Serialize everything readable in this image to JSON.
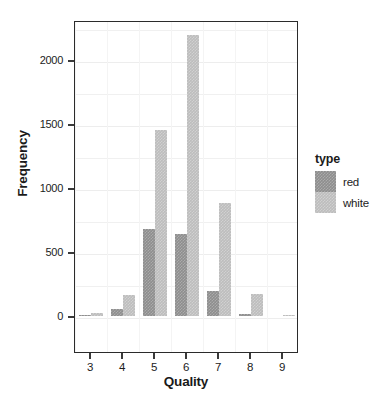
{
  "chart_data": {
    "type": "bar",
    "title": "",
    "xlabel": "Quality",
    "ylabel": "Frequency",
    "categories": [
      "3",
      "4",
      "5",
      "6",
      "7",
      "8",
      "9"
    ],
    "series": [
      {
        "name": "red",
        "color": "#8e8e8e",
        "values": [
          10,
          53,
          681,
          638,
          199,
          18,
          0
        ]
      },
      {
        "name": "white",
        "color": "#bdbdbd",
        "values": [
          20,
          163,
          1457,
          2198,
          880,
          175,
          5
        ]
      }
    ],
    "xtick_labels": [
      "3",
      "4",
      "5",
      "6",
      "7",
      "8",
      "9"
    ],
    "ytick_labels": [
      "0",
      "500",
      "1000",
      "1500",
      "2000"
    ],
    "ytick_values": [
      0,
      500,
      1000,
      1500,
      2000
    ],
    "ylim": [
      0,
      2300
    ],
    "xlim": [
      2.5,
      9.5
    ],
    "grid": true,
    "legend": {
      "title": "type",
      "position": "right",
      "entries": [
        {
          "label": "red",
          "color": "#8e8e8e"
        },
        {
          "label": "white",
          "color": "#bdbdbd"
        }
      ]
    },
    "bar_mode": "dodge",
    "panel_border_color": "#2b2b2b",
    "background": "#ffffff"
  }
}
